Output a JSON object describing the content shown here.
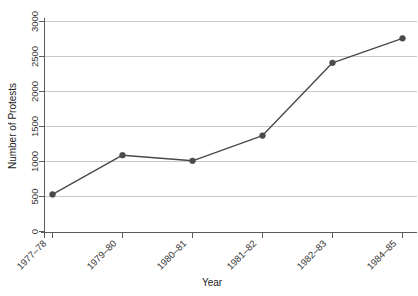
{
  "chart_data": {
    "type": "line",
    "title": "",
    "subtitle": "",
    "xlabel": "Year",
    "ylabel": "Number of Protests",
    "categories": [
      "1977–78",
      "1979–80",
      "1980–81",
      "1981–82",
      "1982–83",
      "1984–85"
    ],
    "values": [
      530,
      1090,
      1010,
      1370,
      2410,
      2760
    ],
    "series": [
      {
        "name": "Number of Protests",
        "values": [
          530,
          1090,
          1010,
          1370,
          2410,
          2760
        ]
      }
    ],
    "ylim": [
      0,
      3000
    ],
    "yticks": [
      0,
      500,
      1000,
      1500,
      2000,
      2500,
      3000
    ],
    "ytick_labels": [
      "0",
      "500",
      "1000",
      "1500",
      "2000",
      "2500",
      "3000"
    ],
    "grid": "horizontal",
    "legend": "none",
    "marker": "filled-circle",
    "line_color": "#4a4a4a",
    "grid_color": "#c8c8c8",
    "axis_color": "#5a5a5a",
    "background_color": "#ffffff",
    "xtick_label_rotation": 45
  },
  "axis": {
    "y_title": "Number of Protests",
    "x_title": "Year"
  },
  "ytick_labels": {
    "t0": "0",
    "t1": "500",
    "t2": "1000",
    "t3": "1500",
    "t4": "2000",
    "t5": "2500",
    "t6": "3000"
  },
  "xtick_labels": {
    "t0": "1977–78",
    "t1": "1979–80",
    "t2": "1980–81",
    "t3": "1981–82",
    "t4": "1982–83",
    "t5": "1984–85"
  }
}
